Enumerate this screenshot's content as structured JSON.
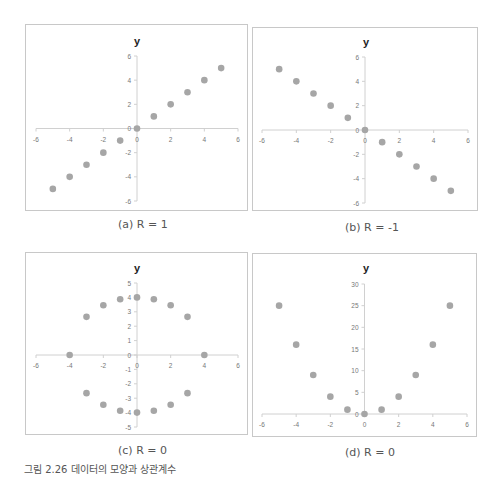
{
  "figure_caption": "그림 2.26 데이터의 모양과 상관계수",
  "style": {
    "marker_color": "#a6a6a6",
    "axis_color": "#d0d0d0",
    "tick_label_color": "#777777",
    "border_color": "#c8c8c8"
  },
  "chart_data": [
    {
      "id": "a",
      "type": "scatter",
      "title": "y",
      "caption": "(a) R = 1",
      "xlim": [
        -6,
        6
      ],
      "ylim": [
        -6,
        6
      ],
      "xticks": [
        -6,
        -4,
        -2,
        0,
        2,
        4,
        6
      ],
      "yticks": [
        -6,
        -4,
        -2,
        0,
        2,
        4,
        6
      ],
      "grid": false,
      "legend": null,
      "x": [
        -5,
        -4,
        -3,
        -2,
        -1,
        0,
        1,
        2,
        3,
        4,
        5
      ],
      "y": [
        -5,
        -4,
        -3,
        -2,
        -1,
        0,
        1,
        2,
        3,
        4,
        5
      ]
    },
    {
      "id": "b",
      "type": "scatter",
      "title": "y",
      "caption": "(b) R = -1",
      "xlim": [
        -6,
        6
      ],
      "ylim": [
        -6,
        6
      ],
      "xticks": [
        -6,
        -4,
        -2,
        0,
        2,
        4,
        6
      ],
      "yticks": [
        -6,
        -4,
        -2,
        0,
        2,
        4,
        6
      ],
      "grid": false,
      "legend": null,
      "x": [
        -5,
        -4,
        -3,
        -2,
        -1,
        0,
        1,
        2,
        3,
        4,
        5
      ],
      "y": [
        5,
        4,
        3,
        2,
        1,
        0,
        -1,
        -2,
        -3,
        -4,
        -5
      ]
    },
    {
      "id": "c",
      "type": "scatter",
      "title": "y",
      "caption": "(c) R = 0",
      "xlim": [
        -6,
        6
      ],
      "ylim": [
        -5,
        5
      ],
      "xticks": [
        -6,
        -4,
        -2,
        0,
        2,
        4,
        6
      ],
      "yticks": [
        -5,
        -4,
        -3,
        -2,
        -1,
        0,
        1,
        2,
        3,
        4,
        5
      ],
      "grid": false,
      "legend": null,
      "x": [
        -4,
        -3,
        -2,
        -1,
        0,
        1,
        2,
        3,
        4,
        3,
        2,
        1,
        0,
        -1,
        -2,
        -3
      ],
      "y": [
        0,
        2.65,
        3.46,
        3.87,
        4,
        3.87,
        3.46,
        2.65,
        0,
        -2.65,
        -3.46,
        -3.87,
        -4,
        -3.87,
        -3.46,
        -2.65
      ]
    },
    {
      "id": "d",
      "type": "scatter",
      "title": "y",
      "caption": "(d) R = 0",
      "xlim": [
        -6,
        6
      ],
      "ylim": [
        0,
        30
      ],
      "xticks": [
        -6,
        -4,
        -2,
        0,
        2,
        4,
        6
      ],
      "yticks": [
        0,
        5,
        10,
        15,
        20,
        25,
        30
      ],
      "grid": false,
      "legend": null,
      "x": [
        -5,
        -4,
        -3,
        -2,
        -1,
        0,
        1,
        2,
        3,
        4,
        5
      ],
      "y": [
        25,
        16,
        9,
        4,
        1,
        0,
        1,
        4,
        9,
        16,
        25
      ]
    }
  ],
  "layout": [
    {
      "box": [
        25,
        24,
        223,
        187
      ],
      "plot": {
        "x0": 36,
        "x1": 238,
        "y_top": 56,
        "y_bottom": 201
      },
      "title_pos": [
        137,
        45
      ],
      "caption_pos": [
        118,
        218
      ]
    },
    {
      "box": [
        252,
        27,
        226,
        184
      ],
      "plot": {
        "x0": 262,
        "x1": 468,
        "y_top": 57,
        "y_bottom": 203
      },
      "title_pos": [
        366,
        46
      ],
      "caption_pos": [
        345,
        221
      ]
    },
    {
      "box": [
        25,
        252,
        223,
        183
      ],
      "plot": {
        "x0": 36,
        "x1": 238,
        "y_top": 283,
        "y_bottom": 427
      },
      "title_pos": [
        137,
        272
      ],
      "caption_pos": [
        118,
        444
      ]
    },
    {
      "box": [
        252,
        253,
        225,
        184
      ],
      "plot": {
        "x0": 262,
        "x1": 467,
        "y_top": 284,
        "y_bottom": 414
      },
      "title_pos": [
        366,
        272
      ],
      "caption_pos": [
        345,
        446
      ]
    }
  ]
}
